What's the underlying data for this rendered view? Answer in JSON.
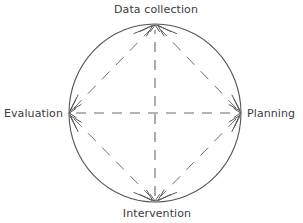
{
  "diagram": {
    "type": "cyclical-process-circle",
    "background_color": "#ffffff",
    "stroke_color": "#555555",
    "dash_color": "#666666",
    "label_color": "#3b3b3b",
    "circle": {
      "center_x": 155,
      "center_y": 113,
      "radius_x": 86,
      "radius_y": 89,
      "stroke_width": 1
    },
    "nodes": [
      {
        "id": "data-collection",
        "label": "Data collection",
        "position": "top",
        "label_x": 156,
        "label_y": 13,
        "anchor": "middle",
        "vertex_x": 155,
        "vertex_y": 24
      },
      {
        "id": "planning",
        "label": "Planning",
        "position": "right",
        "label_x": 247,
        "label_y": 117,
        "anchor": "start",
        "vertex_x": 241,
        "vertex_y": 113
      },
      {
        "id": "intervention",
        "label": "Intervention",
        "position": "bottom",
        "label_x": 157,
        "label_y": 216,
        "anchor": "middle",
        "vertex_x": 155,
        "vertex_y": 202
      },
      {
        "id": "evaluation",
        "label": "Evaluation",
        "position": "left",
        "label_x": 63,
        "label_y": 117,
        "anchor": "end",
        "vertex_x": 69,
        "vertex_y": 113
      }
    ],
    "axes": [
      {
        "id": "vertical-axis",
        "orientation": "vertical",
        "from": "intervention",
        "to": "data-collection",
        "style": "dashed",
        "arrowheads": "both"
      },
      {
        "id": "horizontal-axis",
        "orientation": "horizontal",
        "from": "evaluation",
        "to": "planning",
        "style": "dashed",
        "arrowheads": "both"
      }
    ],
    "diagonals": [
      {
        "id": "diagonal-evaluation-to-data-collection",
        "from": "evaluation",
        "to": "data-collection",
        "style": "dashed"
      },
      {
        "id": "diagonal-planning-to-data-collection",
        "from": "planning",
        "to": "data-collection",
        "style": "dashed"
      },
      {
        "id": "diagonal-evaluation-to-intervention",
        "from": "evaluation",
        "to": "intervention",
        "style": "dashed"
      },
      {
        "id": "diagonal-planning-to-intervention",
        "from": "planning",
        "to": "intervention",
        "style": "dashed"
      }
    ]
  }
}
